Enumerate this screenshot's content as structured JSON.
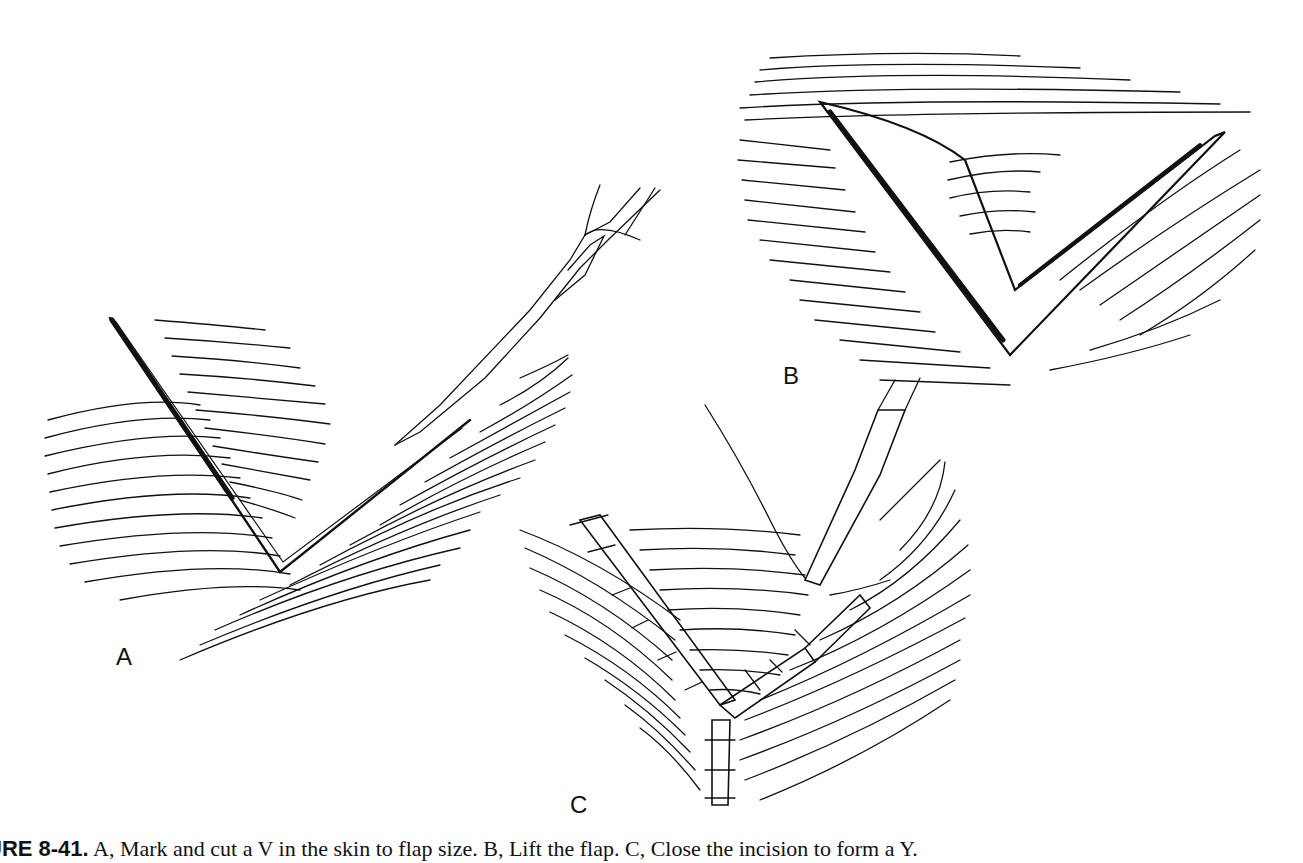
{
  "figure": {
    "panels": [
      {
        "label": "A",
        "description": "V incision marked and cut in skin with scalpel"
      },
      {
        "label": "B",
        "description": "V flap lifted from wound bed"
      },
      {
        "label": "C",
        "description": "Incision closed with sutures into a Y shape"
      }
    ],
    "caption": {
      "figure_number": "URE 8-41.",
      "text": "A, Mark and cut a V in the skin to flap size. B, Lift the flap. C, Close the incision to form a Y."
    }
  }
}
